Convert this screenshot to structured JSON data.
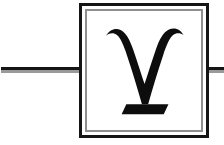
{
  "canvas": {
    "width": 224,
    "height": 145,
    "background_color": "#ffffff"
  },
  "diagram": {
    "type": "quantum-circuit-gate"
  },
  "wire": {
    "label": "qubit-wire",
    "style": "embossed-double-line",
    "dark_color": "#151515",
    "light_color": "#9a9a9a",
    "y": 67,
    "thickness": 6,
    "segments": [
      {
        "name": "left",
        "x": 1,
        "width": 79
      },
      {
        "name": "right",
        "x": 207,
        "width": 17
      }
    ]
  },
  "gate": {
    "name": "gamma-gate",
    "symbol": "γ",
    "symbol_name": "greek-small-letter-gamma",
    "symbol_color": "#0d0d0d",
    "box": {
      "x": 79,
      "y": 3,
      "width": 130,
      "height": 135,
      "outer_border_color": "#151515",
      "outer_border_width": 3,
      "inner_border_color": "#8f8f8f",
      "inner_border_width": 2,
      "inner_border_inset": 3,
      "fill_color": "#ffffff"
    }
  }
}
